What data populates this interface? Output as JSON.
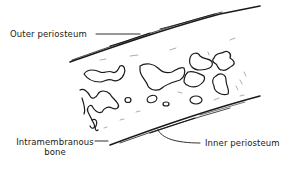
{
  "diagram": {
    "type": "anatomical-line-drawing",
    "labels": {
      "outer_periosteum": "Outer periosteum",
      "intramembranous_bone_line1": "Intramembranous",
      "intramembranous_bone_line2": "bone",
      "inner_periosteum": "Inner periosteum"
    },
    "colors": {
      "ink": "#1a1a1a",
      "background": "#ffffff"
    }
  }
}
